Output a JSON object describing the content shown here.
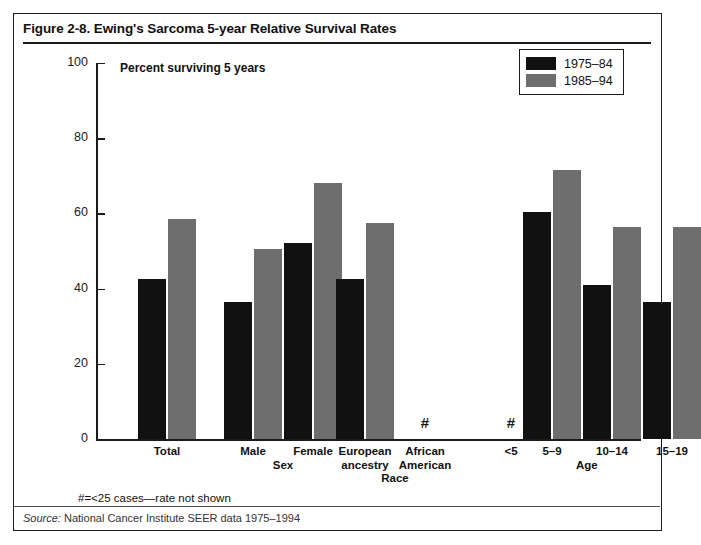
{
  "figure": {
    "title": "Figure 2-8. Ewing's Sarcoma 5-year Relative Survival Rates",
    "plot_note": "Percent surviving 5 years",
    "footnote": "#=<25 cases—rate not shown",
    "source_prefix": "Source:",
    "source_text": " National Cancer Institute SEER data 1975–1994"
  },
  "legend": {
    "entries": [
      {
        "label": "1975–84",
        "color": "#111111"
      },
      {
        "label": "1985–94",
        "color": "#6e6e6e"
      }
    ]
  },
  "axis": {
    "y_ticks": [
      "0",
      "20",
      "40",
      "60",
      "80",
      "100"
    ],
    "y_min": 0,
    "y_max": 100
  },
  "groups": [
    {
      "name": "",
      "categories": [
        "Total"
      ]
    },
    {
      "name": "Sex",
      "categories": [
        "Male",
        "Female"
      ]
    },
    {
      "name": "Race",
      "categories": [
        "European ancestry",
        "African American"
      ]
    },
    {
      "name": "Age",
      "categories": [
        "<5",
        "5–9",
        "10–14",
        "15–19"
      ]
    }
  ],
  "markers": {
    "suppressed": "#"
  },
  "chart_data": {
    "type": "bar",
    "title": "Figure 2-8. Ewing's Sarcoma 5-year Relative Survival Rates",
    "xlabel": "",
    "ylabel": "Percent surviving 5 years",
    "ylim": [
      0,
      100
    ],
    "yticks": [
      0,
      20,
      40,
      60,
      80,
      100
    ],
    "grid": false,
    "legend_position": "top-right",
    "categories": [
      "Total",
      "Male",
      "Female",
      "European ancestry",
      "African American",
      "<5",
      "5–9",
      "10–14",
      "15–19"
    ],
    "series": [
      {
        "name": "1975–84",
        "color": "#111111",
        "values": [
          42.5,
          36.5,
          52.0,
          42.5,
          null,
          null,
          60.5,
          41.0,
          36.5
        ]
      },
      {
        "name": "1985–94",
        "color": "#6e6e6e",
        "values": [
          58.5,
          50.5,
          68.0,
          57.5,
          null,
          null,
          71.5,
          56.5,
          56.5
        ]
      }
    ],
    "suppressed_categories": [
      "African American",
      "<5"
    ],
    "suppressed_marker": "#",
    "annotations": [
      "#=<25 cases—rate not shown",
      "Source: National Cancer Institute SEER data 1975–1994"
    ]
  },
  "layout": {
    "bar_width": 28,
    "positions": {
      "Total": 42,
      "Male": 128,
      "Female": 188,
      "European ancestry": 240,
      "African American": 300,
      "<5": 386,
      "5–9": 427,
      "10–14": 487,
      "15–19": 547
    }
  }
}
